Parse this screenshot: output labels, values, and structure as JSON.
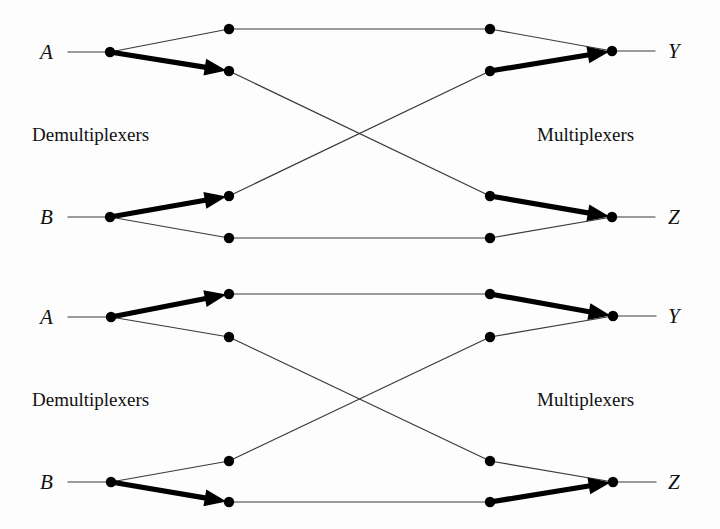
{
  "figure": {
    "kind": "network-diagram",
    "title": "",
    "background_color": "#fdfdfd",
    "line_color": "#3a3a3a",
    "bold_line_color": "#000000",
    "node_color": "#000000",
    "text_color": "#111111",
    "width": 720,
    "height": 529
  },
  "panels": [
    {
      "id": "top",
      "labels": {
        "input_a": "A",
        "input_b": "B",
        "output_y": "Y",
        "output_z": "Z",
        "left_stage": "Demultiplexers",
        "right_stage": "Multiplexers"
      },
      "label_positions": {
        "input_a": {
          "x": 40,
          "y": 52
        },
        "input_b": {
          "x": 40,
          "y": 217
        },
        "output_y": {
          "x": 668,
          "y": 51
        },
        "output_z": {
          "x": 668,
          "y": 217
        },
        "left_stage": {
          "x": 32,
          "y": 134
        },
        "right_stage": {
          "x": 537,
          "y": 134
        }
      },
      "nodes": [
        {
          "name": "demux-a",
          "x": 110,
          "y": 52
        },
        {
          "name": "demux-b",
          "x": 110,
          "y": 217
        },
        {
          "name": "demux-a-out-top",
          "x": 229,
          "y": 29
        },
        {
          "name": "demux-a-out-bottom",
          "x": 229,
          "y": 71
        },
        {
          "name": "demux-b-out-top",
          "x": 229,
          "y": 196
        },
        {
          "name": "demux-b-out-bottom",
          "x": 229,
          "y": 238
        },
        {
          "name": "mux-y-in-top",
          "x": 490,
          "y": 29
        },
        {
          "name": "mux-y-in-bottom",
          "x": 490,
          "y": 71
        },
        {
          "name": "mux-z-in-top",
          "x": 490,
          "y": 196
        },
        {
          "name": "mux-z-in-bottom",
          "x": 490,
          "y": 238
        },
        {
          "name": "mux-y",
          "x": 612,
          "y": 51
        },
        {
          "name": "mux-z",
          "x": 612,
          "y": 217
        }
      ],
      "edges": [
        {
          "name": "stub-a",
          "from": [
            68,
            52
          ],
          "to": [
            110,
            52
          ],
          "bold": false,
          "arrow": false
        },
        {
          "name": "stub-b",
          "from": [
            68,
            217
          ],
          "to": [
            110,
            217
          ],
          "bold": false,
          "arrow": false
        },
        {
          "name": "stub-y",
          "from": [
            612,
            51
          ],
          "to": [
            655,
            51
          ],
          "bold": false,
          "arrow": false
        },
        {
          "name": "stub-z",
          "from": [
            612,
            217
          ],
          "to": [
            655,
            217
          ],
          "bold": false,
          "arrow": false
        },
        {
          "name": "a-to-top",
          "from": [
            110,
            52
          ],
          "to": [
            229,
            29
          ],
          "bold": false,
          "arrow": false
        },
        {
          "name": "a-to-bottom",
          "from": [
            110,
            52
          ],
          "to": [
            229,
            71
          ],
          "bold": true,
          "arrow": true
        },
        {
          "name": "b-to-top",
          "from": [
            110,
            217
          ],
          "to": [
            229,
            196
          ],
          "bold": true,
          "arrow": true
        },
        {
          "name": "b-to-bottom",
          "from": [
            110,
            217
          ],
          "to": [
            229,
            238
          ],
          "bold": false,
          "arrow": false
        },
        {
          "name": "straight-top",
          "from": [
            229,
            29
          ],
          "to": [
            490,
            29
          ],
          "bold": false,
          "arrow": false
        },
        {
          "name": "straight-bottom",
          "from": [
            229,
            238
          ],
          "to": [
            490,
            238
          ],
          "bold": false,
          "arrow": false
        },
        {
          "name": "cross-down",
          "from": [
            229,
            71
          ],
          "to": [
            490,
            196
          ],
          "bold": false,
          "arrow": false
        },
        {
          "name": "cross-up",
          "from": [
            229,
            196
          ],
          "to": [
            490,
            71
          ],
          "bold": false,
          "arrow": false
        },
        {
          "name": "ytop-to-y",
          "from": [
            490,
            29
          ],
          "to": [
            612,
            51
          ],
          "bold": false,
          "arrow": false
        },
        {
          "name": "ybot-to-y",
          "from": [
            490,
            71
          ],
          "to": [
            612,
            51
          ],
          "bold": true,
          "arrow": true
        },
        {
          "name": "ztop-to-z",
          "from": [
            490,
            196
          ],
          "to": [
            612,
            217
          ],
          "bold": true,
          "arrow": true
        },
        {
          "name": "zbot-to-z",
          "from": [
            490,
            238
          ],
          "to": [
            612,
            217
          ],
          "bold": false,
          "arrow": false
        }
      ]
    },
    {
      "id": "bottom",
      "labels": {
        "input_a": "A",
        "input_b": "B",
        "output_y": "Y",
        "output_z": "Z",
        "left_stage": "Demultiplexers",
        "right_stage": "Multiplexers"
      },
      "label_positions": {
        "input_a": {
          "x": 40,
          "y": 317
        },
        "input_b": {
          "x": 40,
          "y": 482
        },
        "output_y": {
          "x": 668,
          "y": 316
        },
        "output_z": {
          "x": 668,
          "y": 482
        },
        "left_stage": {
          "x": 32,
          "y": 399
        },
        "right_stage": {
          "x": 537,
          "y": 399
        }
      },
      "nodes": [
        {
          "name": "demux-a",
          "x": 111,
          "y": 317
        },
        {
          "name": "demux-b",
          "x": 111,
          "y": 482
        },
        {
          "name": "demux-a-out-top",
          "x": 229,
          "y": 294
        },
        {
          "name": "demux-a-out-bottom",
          "x": 229,
          "y": 337
        },
        {
          "name": "demux-b-out-top",
          "x": 229,
          "y": 461
        },
        {
          "name": "demux-b-out-bottom",
          "x": 229,
          "y": 502
        },
        {
          "name": "mux-y-in-top",
          "x": 490,
          "y": 294
        },
        {
          "name": "mux-y-in-bottom",
          "x": 490,
          "y": 337
        },
        {
          "name": "mux-z-in-top",
          "x": 490,
          "y": 461
        },
        {
          "name": "mux-z-in-bottom",
          "x": 490,
          "y": 502
        },
        {
          "name": "mux-y",
          "x": 613,
          "y": 316
        },
        {
          "name": "mux-z",
          "x": 613,
          "y": 482
        }
      ],
      "edges": [
        {
          "name": "stub-a",
          "from": [
            68,
            317
          ],
          "to": [
            111,
            317
          ],
          "bold": false,
          "arrow": false
        },
        {
          "name": "stub-b",
          "from": [
            68,
            482
          ],
          "to": [
            111,
            482
          ],
          "bold": false,
          "arrow": false
        },
        {
          "name": "stub-y",
          "from": [
            613,
            316
          ],
          "to": [
            656,
            316
          ],
          "bold": false,
          "arrow": false
        },
        {
          "name": "stub-z",
          "from": [
            613,
            482
          ],
          "to": [
            656,
            482
          ],
          "bold": false,
          "arrow": false
        },
        {
          "name": "a-to-top",
          "from": [
            111,
            317
          ],
          "to": [
            229,
            294
          ],
          "bold": true,
          "arrow": true
        },
        {
          "name": "a-to-bottom",
          "from": [
            111,
            317
          ],
          "to": [
            229,
            337
          ],
          "bold": false,
          "arrow": false
        },
        {
          "name": "b-to-top",
          "from": [
            111,
            482
          ],
          "to": [
            229,
            461
          ],
          "bold": false,
          "arrow": false
        },
        {
          "name": "b-to-bottom",
          "from": [
            111,
            482
          ],
          "to": [
            229,
            502
          ],
          "bold": true,
          "arrow": true
        },
        {
          "name": "straight-top",
          "from": [
            229,
            294
          ],
          "to": [
            490,
            294
          ],
          "bold": false,
          "arrow": false
        },
        {
          "name": "straight-bottom",
          "from": [
            229,
            502
          ],
          "to": [
            490,
            502
          ],
          "bold": false,
          "arrow": false
        },
        {
          "name": "cross-down",
          "from": [
            229,
            337
          ],
          "to": [
            490,
            461
          ],
          "bold": false,
          "arrow": false
        },
        {
          "name": "cross-up",
          "from": [
            229,
            461
          ],
          "to": [
            490,
            337
          ],
          "bold": false,
          "arrow": false
        },
        {
          "name": "ytop-to-y",
          "from": [
            490,
            294
          ],
          "to": [
            613,
            316
          ],
          "bold": true,
          "arrow": true
        },
        {
          "name": "ybot-to-y",
          "from": [
            490,
            337
          ],
          "to": [
            613,
            316
          ],
          "bold": false,
          "arrow": false
        },
        {
          "name": "ztop-to-z",
          "from": [
            490,
            461
          ],
          "to": [
            613,
            482
          ],
          "bold": false,
          "arrow": false
        },
        {
          "name": "zbot-to-z",
          "from": [
            490,
            502
          ],
          "to": [
            613,
            482
          ],
          "bold": true,
          "arrow": true
        }
      ]
    }
  ]
}
